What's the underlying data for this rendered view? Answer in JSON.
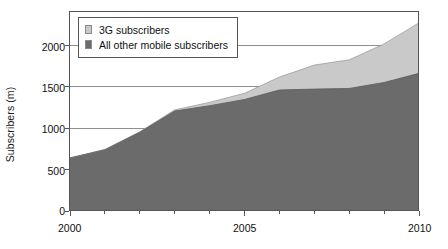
{
  "chart_data": {
    "type": "area",
    "stacked": true,
    "title": "",
    "subtitle": "",
    "xlabel": "",
    "ylabel": "Subscribers (m)",
    "xlim": [
      2000,
      2010
    ],
    "ylim": [
      0,
      2400
    ],
    "grid": true,
    "grid_axis": "y",
    "legend_position": "top-left",
    "x": [
      2000,
      2001,
      2002,
      2003,
      2004,
      2005,
      2006,
      2007,
      2008,
      2009,
      2010
    ],
    "x_tick_labels": [
      "2000",
      "2005",
      "2010"
    ],
    "x_tick_values": [
      2000,
      2005,
      2010
    ],
    "x_minor_ticks": [
      2001,
      2002,
      2003,
      2004,
      2006,
      2007,
      2008,
      2009
    ],
    "y_tick_labels": [
      "0",
      "500",
      "1000",
      "1500",
      "2000"
    ],
    "y_tick_values": [
      0,
      500,
      1000,
      1500,
      2000
    ],
    "series": [
      {
        "name": "All other mobile subscribers",
        "color": "#6b6b6b",
        "values": [
          640,
          740,
          950,
          1205,
          1270,
          1345,
          1460,
          1470,
          1478,
          1550,
          1660
        ]
      },
      {
        "name": "3G subscribers",
        "color": "#c9c9c9",
        "values": [
          0,
          0,
          5,
          15,
          40,
          75,
          155,
          290,
          345,
          465,
          610
        ]
      }
    ],
    "totals": [
      640,
      740,
      955,
      1220,
      1310,
      1420,
      1615,
      1760,
      1823,
      2015,
      2270
    ]
  },
  "legend": {
    "items": [
      {
        "label": "3G subscribers",
        "color": "#c9c9c9"
      },
      {
        "label": "All other mobile subscribers",
        "color": "#6b6b6b"
      }
    ]
  },
  "axes": {
    "y_title": "Subscribers (m)",
    "y_ticks": [
      {
        "label": "2000",
        "value": 2000
      },
      {
        "label": "1500",
        "value": 1500
      },
      {
        "label": "1000",
        "value": 1000
      },
      {
        "label": "500",
        "value": 500
      },
      {
        "label": "0",
        "value": 0
      }
    ],
    "x_ticks": [
      {
        "label": "2000",
        "value": 2000
      },
      {
        "label": "2005",
        "value": 2005
      },
      {
        "label": "2010",
        "value": 2010
      }
    ]
  },
  "colors": {
    "series_3g": "#c9c9c9",
    "series_other": "#6b6b6b",
    "axis": "#555555",
    "gridline": "#8f8f8f",
    "text": "#111111",
    "background": "#ffffff"
  }
}
